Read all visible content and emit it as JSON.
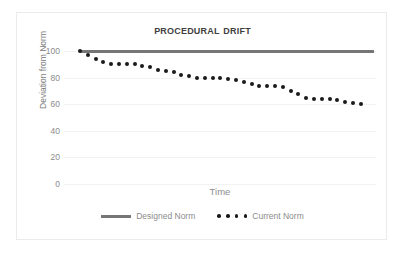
{
  "chart_data": {
    "type": "scatter",
    "title": "Procedural Drift",
    "xlabel": "Time",
    "ylabel": "Deviation from Norm",
    "ylim": [
      0,
      100
    ],
    "yticks": [
      100,
      80,
      60,
      40,
      20,
      0
    ],
    "ytick_labels": [
      "100",
      "80",
      "60",
      "40",
      "20",
      "0"
    ],
    "grid": true,
    "legend_position": "bottom",
    "xticks_visible": false,
    "series": [
      {
        "name": "Designed Norm",
        "style": "line",
        "color": "#767676",
        "values": [
          100,
          100,
          100,
          100,
          100,
          100,
          100,
          100,
          100,
          100,
          100,
          100,
          100,
          100,
          100,
          100,
          100,
          100,
          100,
          100,
          100,
          100,
          100,
          100,
          100,
          100,
          100,
          100,
          100,
          100,
          100,
          100
        ]
      },
      {
        "name": "Current Norm",
        "style": "dotted-markers",
        "color": "#1a1a1a",
        "values": [
          100,
          97,
          94,
          92,
          90,
          90,
          90,
          90,
          89,
          88,
          86,
          85,
          84,
          82,
          81,
          80,
          80,
          80,
          80,
          79,
          78,
          77,
          75,
          74,
          74,
          74,
          73,
          70,
          68,
          65,
          64,
          64,
          64,
          63,
          62,
          61,
          60
        ]
      }
    ]
  },
  "legend": {
    "entries": [
      {
        "label": "Designed Norm",
        "marker": "solid-line"
      },
      {
        "label": "Current Norm",
        "marker": "dotted"
      }
    ]
  }
}
